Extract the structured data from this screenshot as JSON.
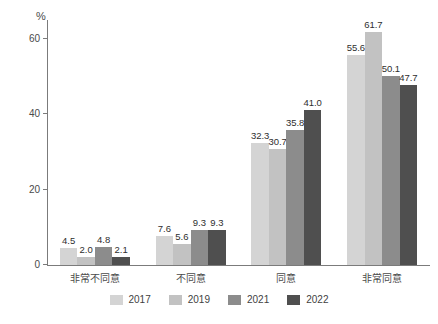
{
  "chart_data": {
    "type": "bar",
    "title": "",
    "subtitle": "",
    "xlabel": "",
    "ylabel": "%",
    "ylim": [
      0,
      65
    ],
    "yticks": [
      0,
      20,
      40,
      60
    ],
    "ytick_labels": [
      "0",
      "20",
      "40",
      "60"
    ],
    "grid": false,
    "legend_position": "bottom",
    "grouping": "grouped",
    "categories": [
      "非常不同意",
      "不同意",
      "同意",
      "非常同意"
    ],
    "series": [
      {
        "name": "2017",
        "color": "#d4d4d4",
        "values": [
          4.5,
          7.6,
          32.3,
          55.6
        ],
        "value_labels": [
          "4.5",
          "7.6",
          "32.3",
          "55.6"
        ]
      },
      {
        "name": "2019",
        "color": "#c2c2c2",
        "values": [
          2.0,
          5.6,
          30.7,
          61.7
        ],
        "value_labels": [
          "2.0",
          "5.6",
          "30.7",
          "61.7"
        ]
      },
      {
        "name": "2021",
        "color": "#8c8c8c",
        "values": [
          4.8,
          9.3,
          35.8,
          50.1
        ],
        "value_labels": [
          "4.8",
          "9.3",
          "35.8",
          "50.1"
        ]
      },
      {
        "name": "2022",
        "color": "#4f4f4f",
        "values": [
          2.1,
          9.3,
          41.0,
          47.7
        ],
        "value_labels": [
          "2.1",
          "9.3",
          "41.0",
          "47.7"
        ]
      }
    ]
  },
  "axis": {
    "unit_label": "%",
    "axis_color": "#7b7b7b"
  },
  "legend": {
    "items": [
      {
        "label": "2017",
        "color": "#d4d4d4"
      },
      {
        "label": "2019",
        "color": "#c2c2c2"
      },
      {
        "label": "2021",
        "color": "#8c8c8c"
      },
      {
        "label": "2022",
        "color": "#4f4f4f"
      }
    ]
  }
}
